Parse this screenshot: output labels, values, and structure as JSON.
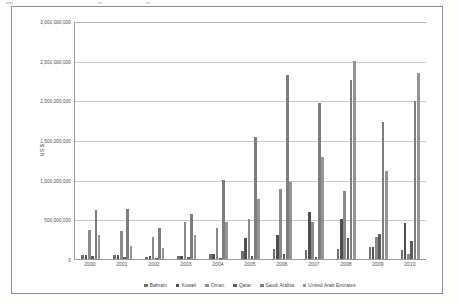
{
  "chart_data": {
    "type": "bar",
    "title": "",
    "xlabel": "",
    "ylabel": "US $",
    "ylim": [
      0,
      3000000000
    ],
    "grid": true,
    "legend_position": "bottom",
    "categories": [
      "2000",
      "2001",
      "2002",
      "2003",
      "2004",
      "2005",
      "2006",
      "2007",
      "2008",
      "2009",
      "2010"
    ],
    "ytick_labels": [
      "3,000,000,000",
      "2,500,000,000",
      "2,000,000,000",
      "1,500,000,000",
      "1,000,000,000",
      "500,000,000",
      "0"
    ],
    "ytick_values": [
      3000000000,
      2500000000,
      2000000000,
      1500000000,
      1000000000,
      500000000,
      0
    ],
    "series": [
      {
        "name": "Bahrain",
        "color": "#6f6f6f",
        "values": [
          50000000,
          45000000,
          30000000,
          35000000,
          60000000,
          95000000,
          130000000,
          115000000,
          130000000,
          150000000,
          110000000
        ]
      },
      {
        "name": "Kuwait",
        "color": "#4f4f4f",
        "values": [
          55000000,
          55000000,
          35000000,
          40000000,
          65000000,
          260000000,
          300000000,
          590000000,
          500000000,
          150000000,
          450000000
        ]
      },
      {
        "name": "Oman",
        "color": "#8a8a8a",
        "values": [
          360000000,
          350000000,
          280000000,
          465000000,
          390000000,
          500000000,
          880000000,
          465000000,
          855000000,
          280000000,
          65000000
        ]
      },
      {
        "name": "Qatar",
        "color": "#5c5c5c",
        "values": [
          35000000,
          30000000,
          15000000,
          25000000,
          15000000,
          40000000,
          65000000,
          20000000,
          260000000,
          310000000,
          230000000
        ]
      },
      {
        "name": "Saudi Arabia",
        "color": "#7d7d7d",
        "values": [
          620000000,
          630000000,
          390000000,
          570000000,
          1000000000,
          1535000000,
          2315000000,
          1965000000,
          2255000000,
          1730000000,
          1995000000
        ]
      },
      {
        "name": "United Arab Emirates",
        "color": "#959595",
        "values": [
          300000000,
          160000000,
          135000000,
          300000000,
          470000000,
          755000000,
          965000000,
          1280000000,
          2490000000,
          1105000000,
          2340000000
        ]
      }
    ]
  }
}
